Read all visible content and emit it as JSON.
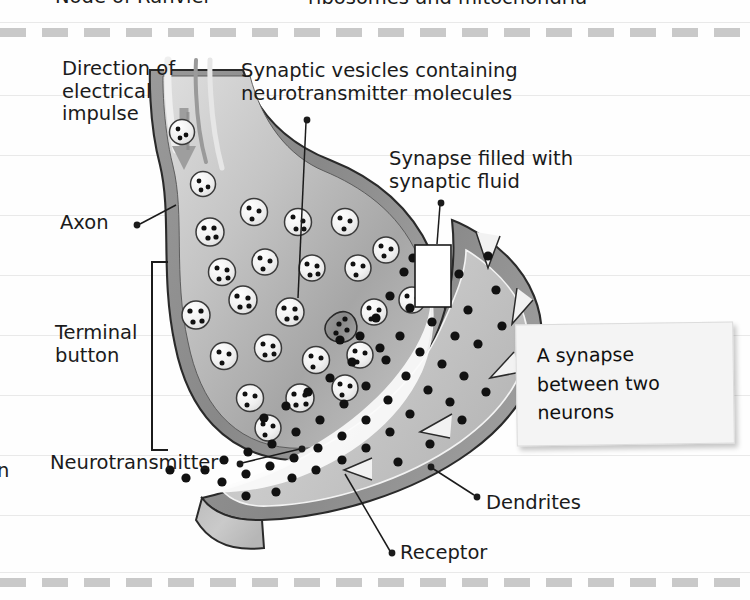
{
  "figure": {
    "title_partial_top_left": "Node of Ranvier",
    "title_partial_top_right": "ribosomes and mitochondria",
    "edge_fragment_left": "n",
    "type": "biology-diagram",
    "subject": "A synapse between two neurons"
  },
  "labels": {
    "direction": "Direction of\nelectrical\nimpulse",
    "vesicles": "Synaptic vesicles containing\nneurotransmitter molecules",
    "synapse": "Synapse filled with\nsynaptic fluid",
    "axon": "Axon",
    "terminal_button": "Terminal\nbutton",
    "neurotransmitter": "Neurotransmitter",
    "dendrites": "Dendrites",
    "receptor": "Receptor"
  },
  "callout": {
    "line1": "A synapse",
    "line2": "between two",
    "line3": "neurons"
  },
  "colors": {
    "page_background": "#fefefe",
    "rule_line": "#e9e9e9",
    "dashed_band": "#c9c9c9",
    "membrane_dark": "#8d8d8d",
    "cytoplasm_light": "#cfcfcf",
    "cytoplasm_mid": "#b4b4b4",
    "post_neuron": "#c6c6c6",
    "outline": "#2a2a2a",
    "vesicle_fill": "#f2f2f2",
    "molecule": "#111111",
    "note_background": "#f4f4f4",
    "text": "#1b1b1b"
  },
  "art": {
    "rule_lines_y": [
      22,
      95,
      155,
      215,
      275,
      335,
      395,
      455,
      515,
      572
    ],
    "dash_bands_y": [
      28,
      578
    ],
    "vesicle_count": 24,
    "neurotransmitter_dot_count": 62,
    "receptor_notch_count": 5
  }
}
